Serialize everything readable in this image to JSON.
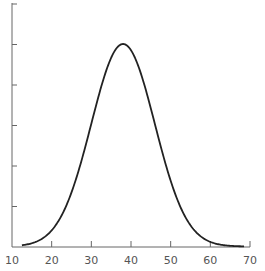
{
  "chart_data": {
    "type": "line",
    "title": "",
    "xlabel": "",
    "ylabel": "",
    "xlim": [
      10,
      70
    ],
    "ylim": [
      0,
      6
    ],
    "grid": false,
    "legend": null,
    "x_ticks": [
      10,
      20,
      30,
      40,
      50,
      60,
      70
    ],
    "x_tick_labels": [
      "10",
      "20",
      "30",
      "40",
      "50",
      "60",
      "70"
    ],
    "y_ticks": [
      1,
      2,
      3,
      4,
      5,
      6
    ],
    "y_tick_labels": [
      "",
      "",
      "",
      "",
      "",
      ""
    ],
    "series": [
      {
        "name": "normal distribution curve",
        "distribution": "normal",
        "mean": 38,
        "sd": 8,
        "peak": 5,
        "x": [
          12,
          15,
          18,
          20,
          22,
          25,
          28,
          30,
          32,
          35,
          38,
          41,
          44,
          46,
          48,
          51,
          54,
          56,
          58,
          60,
          63,
          66,
          68
        ],
        "y": [
          0.01,
          0.07,
          0.22,
          0.4,
          0.68,
          1.34,
          2.29,
          3.02,
          3.77,
          4.65,
          5.0,
          4.65,
          3.77,
          3.02,
          2.29,
          1.34,
          0.68,
          0.4,
          0.22,
          0.11,
          0.04,
          0.01,
          0.0
        ]
      }
    ],
    "colors": {
      "axis": "#666666",
      "curve": "#222222"
    }
  }
}
